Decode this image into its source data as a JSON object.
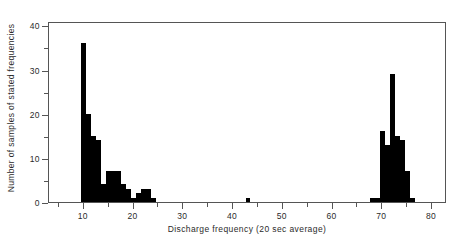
{
  "chart_data": {
    "type": "bar",
    "title": "",
    "subtitle": "",
    "xlabel": "Discharge frequency  (20 sec average)",
    "ylabel": "Number of samples of stated frequencies",
    "xlim": [
      3,
      83
    ],
    "ylim": [
      0,
      41
    ],
    "xticks": [
      10,
      20,
      30,
      40,
      50,
      60,
      70,
      80
    ],
    "xtick_labels": [
      "10",
      "20",
      "30",
      "40",
      "50",
      "60",
      "70",
      "80"
    ],
    "xminor_ticks": [
      5,
      15,
      25,
      35,
      45,
      55,
      65,
      75
    ],
    "yticks": [
      0,
      10,
      20,
      30,
      40
    ],
    "ytick_labels": [
      "0",
      "10",
      "20",
      "30",
      "40"
    ],
    "yminor_ticks": [
      5,
      15,
      25,
      35
    ],
    "grid": false,
    "legend": null,
    "bar_color": "#000000",
    "bin_width": 1,
    "categories": [
      10,
      11,
      12,
      13,
      14,
      15,
      16,
      17,
      18,
      19,
      20,
      21,
      22,
      23,
      24,
      43,
      68,
      69,
      70,
      71,
      72,
      73,
      74,
      75,
      76
    ],
    "values": [
      36,
      20,
      15,
      14,
      4,
      7,
      7,
      7,
      4,
      3,
      1,
      2,
      3,
      3,
      1,
      1,
      1,
      1,
      16,
      13,
      29,
      15,
      14,
      7,
      1
    ],
    "annotations": []
  }
}
